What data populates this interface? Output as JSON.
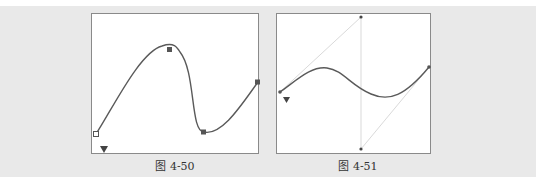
{
  "figures": [
    {
      "id": "fig-4-50",
      "caption": "图 4-50",
      "description": "Bezier path with four square anchor points; start-point triangle marker",
      "anchors": [
        [
          4,
          120
        ],
        [
          78,
          36
        ],
        [
          112,
          118
        ],
        [
          166,
          68
        ]
      ],
      "start_marker": [
        12,
        135
      ]
    },
    {
      "id": "fig-4-51",
      "caption": "图 4-51",
      "description": "Smooth S-curve with two anchors; control handles drawn as thin lines to handle points",
      "anchors": [
        [
          3,
          78
        ],
        [
          152,
          53
        ]
      ],
      "handles": [
        [
          [
            3,
            78
          ],
          [
            84,
            3
          ]
        ],
        [
          [
            84,
            3
          ],
          [
            84,
            135
          ]
        ],
        [
          [
            84,
            135
          ],
          [
            152,
            53
          ]
        ]
      ],
      "start_marker": [
        10,
        86
      ]
    }
  ],
  "colors": {
    "band": "#e9e9e9",
    "frame_border": "#8a8a8a",
    "curve": "#5a5a5a",
    "anchor": "#555555",
    "handle_line": "#c8c8c8"
  }
}
